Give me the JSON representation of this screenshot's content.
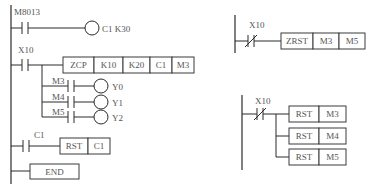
{
  "diagram_type": "PLC ladder diagram",
  "left_program": {
    "rungs": [
      {
        "contact": {
          "label": "M8013",
          "type": "NO"
        },
        "output": {
          "type": "coil",
          "label": "C1 K30"
        }
      },
      {
        "contact": {
          "label": "X10",
          "type": "NO"
        },
        "instruction": [
          "ZCP",
          "K10",
          "K20",
          "C1",
          "M3"
        ],
        "branches": [
          {
            "contact": "M3",
            "coil": "Y0"
          },
          {
            "contact": "M4",
            "coil": "Y1"
          },
          {
            "contact": "M5",
            "coil": "Y2"
          }
        ]
      },
      {
        "contact": {
          "label": "C1",
          "type": "NO"
        },
        "instruction": [
          "RST",
          "C1"
        ]
      },
      {
        "instruction": [
          "END"
        ]
      }
    ]
  },
  "right_program_a": {
    "contact": {
      "label": "X10",
      "type": "NC"
    },
    "instruction": [
      "ZRST",
      "M3",
      "M5"
    ]
  },
  "right_program_b": {
    "contact": {
      "label": "X10",
      "type": "NC"
    },
    "instructions": [
      [
        "RST",
        "M3"
      ],
      [
        "RST",
        "M4"
      ],
      [
        "RST",
        "M5"
      ]
    ]
  }
}
